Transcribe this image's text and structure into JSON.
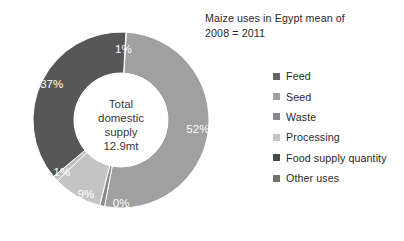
{
  "title": {
    "line1": "Maize uses in Egypt mean of",
    "line2": "2008 = 2011"
  },
  "center": {
    "line1": "Total",
    "line2": "domestic",
    "line3": "supply",
    "line4": "12.9mt"
  },
  "legend": {
    "items": [
      {
        "label": "Feed",
        "color": "#666666"
      },
      {
        "label": "Seed",
        "color": "#a0a0a0"
      },
      {
        "label": "Waste",
        "color": "#8a8a8a"
      },
      {
        "label": "Processing",
        "color": "#c4c4c4"
      },
      {
        "label": "Food supply quantity",
        "color": "#4a4a4a"
      },
      {
        "label": "Other uses",
        "color": "#707070"
      }
    ]
  },
  "chart_data": {
    "type": "pie",
    "variant": "donut",
    "title": "Maize uses in Egypt mean of 2008 = 2011",
    "center_label": "Total domestic supply 12.9mt",
    "total": "12.9mt",
    "legend_position": "right",
    "grid": false,
    "labels": [
      "Feed",
      "Seed",
      "Waste",
      "Processing",
      "Food supply quantity",
      "Other uses"
    ],
    "values": [
      1,
      52,
      0,
      9,
      1,
      37
    ],
    "value_labels": [
      "1%",
      "52%",
      "0%",
      "9%",
      "1%",
      "37%"
    ],
    "colors": [
      "#666666",
      "#a0a0a0",
      "#8a8a8a",
      "#c4c4c4",
      "#4a4a4a",
      "#707070"
    ],
    "slices": [
      {
        "name": "Feed",
        "value": 1,
        "label": "1%",
        "color": "#666666"
      },
      {
        "name": "Seed",
        "value": 52,
        "label": "52%",
        "color": "#a0a0a0"
      },
      {
        "name": "Waste",
        "value": 0,
        "label": "0%",
        "color": "#8a8a8a"
      },
      {
        "name": "Processing",
        "value": 9,
        "label": "9%",
        "color": "#c4c4c4"
      },
      {
        "name": "Food supply quantity",
        "value": 1,
        "label": "1%",
        "color": "#bfbfbf"
      },
      {
        "name": "Other uses",
        "value": 37,
        "label": "37%",
        "color": "#575757"
      }
    ]
  }
}
